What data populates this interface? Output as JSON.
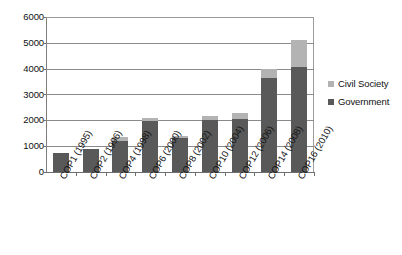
{
  "chart_data": {
    "type": "bar",
    "subtype": "stacked-column",
    "title": "",
    "xlabel": "",
    "ylabel": "",
    "ylim": [
      0,
      6000
    ],
    "ytick_labels": [
      "0",
      "1000",
      "2000",
      "3000",
      "4000",
      "5000",
      "6000"
    ],
    "ytick_values": [
      0,
      1000,
      2000,
      3000,
      4000,
      5000,
      6000
    ],
    "grid": true,
    "grid_axis": "y",
    "legend_position": "right",
    "categories": [
      "COP1 (1995)",
      "COP2 (1996)",
      "COP4 (1998)",
      "COP6 (2000)",
      "COP8 (2002)",
      "COP10 (2004)",
      "COP12 (2006)",
      "COP14 (2008)",
      "COP16 (2010)"
    ],
    "series": [
      {
        "name": "Government",
        "color": "#595959",
        "values": [
          750,
          890,
          1200,
          1990,
          1320,
          2000,
          2050,
          3630,
          4080
        ]
      },
      {
        "name": "Civil Society",
        "color": "#b3b3b3",
        "values": [
          0,
          0,
          150,
          110,
          90,
          170,
          230,
          350,
          1040
        ]
      }
    ],
    "totals": [
      750,
      890,
      1350,
      2100,
      1410,
      2170,
      2280,
      3980,
      5120
    ]
  },
  "legend": {
    "items": [
      {
        "label": "Civil Society",
        "color": "#b3b3b3"
      },
      {
        "label": "Government",
        "color": "#595959"
      }
    ]
  }
}
